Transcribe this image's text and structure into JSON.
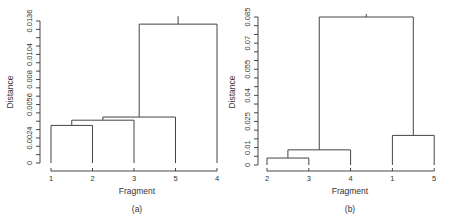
{
  "chart_data": [
    {
      "type": "dendrogram",
      "caption": "(a)",
      "xlabel": "Fragment",
      "ylabel": "Distance",
      "ylim": [
        0,
        0.0136
      ],
      "yticks": [
        0,
        0.0008,
        0.0016,
        0.0024,
        0.0032,
        0.004,
        0.0048,
        0.0056,
        0.0064,
        0.0072,
        0.008,
        0.0088,
        0.0096,
        0.0104,
        0.0112,
        0.012,
        0.0128,
        0.0136
      ],
      "ytick_labels": [
        "0",
        "0.0024",
        "0.0056",
        "0.008",
        "0.0104",
        "0.0136"
      ],
      "ytick_label_values": [
        0,
        0.0024,
        0.0056,
        0.008,
        0.0104,
        0.0136
      ],
      "leaf_order": [
        "1",
        "2",
        "3",
        "5",
        "4"
      ],
      "merges": [
        {
          "left": "1",
          "right": "2",
          "height": 0.0036
        },
        {
          "left": "1-2",
          "right": "3",
          "height": 0.0041
        },
        {
          "left": "1-2-3",
          "right": "5",
          "height": 0.0044
        },
        {
          "left": "1-2-3-5",
          "right": "4",
          "height": 0.0133
        }
      ],
      "grid": false
    },
    {
      "type": "dendrogram",
      "caption": "(b)",
      "xlabel": "Fragment",
      "ylabel": "Distance",
      "ylim": [
        0,
        0.085
      ],
      "yticks": [
        0,
        0.005,
        0.01,
        0.015,
        0.02,
        0.025,
        0.03,
        0.035,
        0.04,
        0.045,
        0.05,
        0.055,
        0.06,
        0.065,
        0.07,
        0.075,
        0.08,
        0.085
      ],
      "ytick_labels": [
        "0",
        "0.01",
        "0.025",
        "0.04",
        "0.055",
        "0.07",
        "0.085"
      ],
      "ytick_label_values": [
        0,
        0.01,
        0.025,
        0.04,
        0.055,
        0.07,
        0.085
      ],
      "leaf_order": [
        "2",
        "3",
        "4",
        "1",
        "5"
      ],
      "merges": [
        {
          "left": "2",
          "right": "3",
          "height": 0.004
        },
        {
          "left": "2-3",
          "right": "4",
          "height": 0.0087
        },
        {
          "left": "1",
          "right": "5",
          "height": 0.017
        },
        {
          "left": "2-3-4",
          "right": "1-5",
          "height": 0.085
        }
      ],
      "grid": false
    }
  ]
}
